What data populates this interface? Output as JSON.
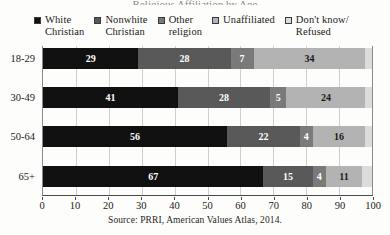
{
  "title_trace": "Religious Affiliation by Age",
  "source": "Source: PRRI, American Values Atlas, 2014.",
  "legend": {
    "items": [
      {
        "label": "White\nChristian",
        "color": "#111111",
        "key": "white_christian"
      },
      {
        "label": "Nonwhite\nChristian",
        "color": "#595959",
        "key": "nonwhite_christian"
      },
      {
        "label": "Other\nreligion",
        "color": "#7a7a7a",
        "key": "other_religion"
      },
      {
        "label": "Unaffiliated",
        "color": "#b3b3b3",
        "key": "unaffiliated"
      },
      {
        "label": "Don't know/\nRefused",
        "color": "#dcdcdc",
        "key": "dont_know"
      }
    ]
  },
  "chart_data": {
    "type": "bar",
    "orientation": "horizontal",
    "stacked": true,
    "title": "",
    "xlabel": "",
    "ylabel": "",
    "xlim": [
      0,
      100
    ],
    "xticks": [
      0,
      10,
      20,
      30,
      40,
      50,
      60,
      70,
      80,
      90,
      100
    ],
    "grid": true,
    "legend_position": "top",
    "categories": [
      "18-29",
      "30-49",
      "50-64",
      "65+"
    ],
    "series": [
      {
        "name": "White Christian",
        "color": "#111111",
        "values": [
          29,
          41,
          56,
          67
        ],
        "label_color": "light"
      },
      {
        "name": "Nonwhite Christian",
        "color": "#595959",
        "values": [
          28,
          28,
          22,
          15
        ],
        "label_color": "light"
      },
      {
        "name": "Other religion",
        "color": "#7a7a7a",
        "values": [
          7,
          5,
          4,
          4
        ],
        "label_color": "light"
      },
      {
        "name": "Unaffiliated",
        "color": "#b3b3b3",
        "values": [
          34,
          24,
          16,
          11
        ],
        "label_color": "dark"
      },
      {
        "name": "Don't know/Refused",
        "color": "#dcdcdc",
        "values": [
          2,
          2,
          2,
          3
        ],
        "label_color": "dark",
        "labels_hidden": true
      }
    ]
  }
}
